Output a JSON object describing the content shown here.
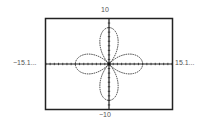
{
  "chart_data": {
    "type": "line",
    "title": "",
    "subtitle": "",
    "xlabel": "",
    "ylabel": "",
    "equation": "r = 8cos(2θ)",
    "xlim": [
      -15.1,
      15.1
    ],
    "ylim": [
      -10,
      10
    ],
    "window_labels": {
      "ymax": "10",
      "ymin": "−10",
      "xmin": "−15.1...",
      "xmax": "15.1..."
    },
    "x_tick_spacing": 1,
    "y_tick_spacing": 1,
    "grid": false,
    "legend": null,
    "series": [
      {
        "name": "rose",
        "style": "dotted",
        "petals": [
          {
            "direction": "right",
            "tip": [
              8,
              0
            ]
          },
          {
            "direction": "up",
            "tip": [
              0,
              8
            ]
          },
          {
            "direction": "left",
            "tip": [
              -8,
              0
            ]
          },
          {
            "direction": "down",
            "tip": [
              0,
              -8
            ]
          }
        ],
        "amplitude": 8,
        "k": 2
      }
    ]
  },
  "labels": {
    "top": "10",
    "bottom": "−10",
    "left": "−15.1...",
    "right": "15.1..."
  },
  "colors": {
    "frame": "#222222",
    "axis": "#222222",
    "curve": "#333333",
    "label": "#555555"
  }
}
